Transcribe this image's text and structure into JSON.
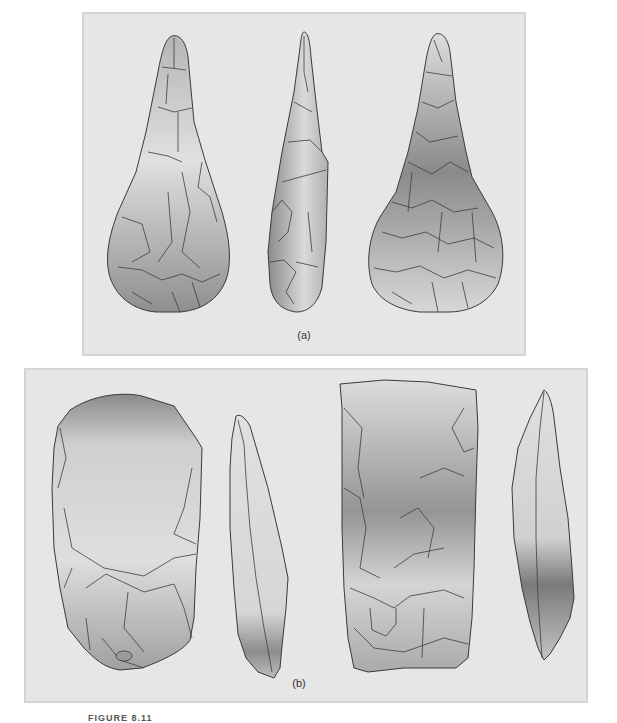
{
  "figure": {
    "caption_partial": "FIGURE 8.11",
    "panels": [
      {
        "id": "a",
        "label": "(a)",
        "description": "Pear-shaped (pointed) handaxe shown in three views: face, profile, reverse face",
        "views": [
          "front-face",
          "side-profile",
          "back-face"
        ]
      },
      {
        "id": "b",
        "label": "(b)",
        "description": "Two flake tools/cleavers each shown in face and profile view",
        "views": [
          "tool-1-face",
          "tool-1-profile",
          "tool-2-face",
          "tool-2-profile"
        ]
      }
    ],
    "colors": {
      "panel_background": "#e6e6e6",
      "panel_border": "#d4d4d4",
      "stone_light": "#e2e2e2",
      "stone_dark": "#7d7d7d",
      "outline": "#3a3a3a"
    }
  }
}
